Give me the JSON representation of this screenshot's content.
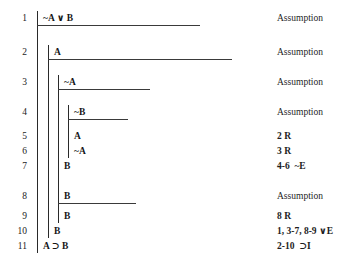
{
  "proof": {
    "title": "Conditional Proof of A ⊃ B from ~A ∨ B",
    "lines": [
      {
        "number": "1",
        "formula": "~A ∨ B",
        "justification": "Assumption",
        "depth": 0
      },
      {
        "number": "2",
        "formula": "A",
        "justification": "Assumption",
        "depth": 1
      },
      {
        "number": "3",
        "formula": "~A",
        "justification": "Assumption",
        "depth": 2
      },
      {
        "number": "4",
        "formula": "~B",
        "justification": "Assumption",
        "depth": 3
      },
      {
        "number": "5",
        "formula": "A",
        "justification": "2 R",
        "depth": 3
      },
      {
        "number": "6",
        "formula": "~A",
        "justification": "3 R",
        "depth": 3
      },
      {
        "number": "7",
        "formula": "B",
        "justification": "4-6  ~E",
        "depth": 2
      },
      {
        "number": "8",
        "formula": "B",
        "justification": "Assumption",
        "depth": 2
      },
      {
        "number": "9",
        "formula": "B",
        "justification": "8 R",
        "depth": 2
      },
      {
        "number": "10",
        "formula": "B",
        "justification": "1, 3-7, 8-9 ∨E",
        "depth": 1
      },
      {
        "number": "11",
        "formula": "A ⊃ B",
        "justification": "2-10  ⊃I",
        "depth": 0
      }
    ]
  },
  "symbols": {
    "negation": "~",
    "disjunction": "∨",
    "conditional": "⊃"
  },
  "layout": {
    "number_column_right": 27,
    "justification_left": 277,
    "scope_x": [
      37,
      48,
      58,
      68
    ],
    "line_y": [
      14,
      48,
      78,
      108,
      132,
      147,
      162,
      192,
      212,
      227,
      242
    ]
  }
}
